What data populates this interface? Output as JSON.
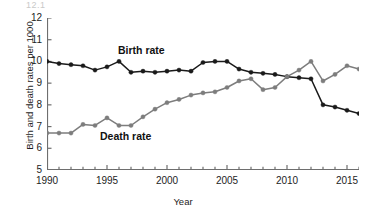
{
  "figure": {
    "crop_artifact_text": "12.1",
    "background": "#ffffff"
  },
  "chart_data": {
    "type": "line",
    "title": "",
    "xlabel": "Year",
    "ylabel": "Birth and death rates per 1000",
    "xlim": [
      1990,
      2016
    ],
    "ylim": [
      5,
      12
    ],
    "xticks": [
      1990,
      1995,
      2000,
      2005,
      2010,
      2015
    ],
    "xtick_labels": [
      "1990",
      "1995",
      "2000",
      "2005",
      "2010",
      "2015"
    ],
    "minor_xticks_interval": 1,
    "yticks": [
      5,
      6,
      7,
      8,
      9,
      10,
      11,
      12
    ],
    "ytick_labels": [
      "5",
      "6",
      "7",
      "8",
      "9",
      "10",
      "11",
      "12"
    ],
    "grid": false,
    "legend_position": "inline-annotations",
    "x": [
      1990,
      1991,
      1992,
      1993,
      1994,
      1995,
      1996,
      1997,
      1998,
      1999,
      2000,
      2001,
      2002,
      2003,
      2004,
      2005,
      2006,
      2007,
      2008,
      2009,
      2010,
      2011,
      2012,
      2013,
      2014,
      2015,
      2016
    ],
    "series": [
      {
        "name": "Birth rate",
        "color": "#1a1a1a",
        "marker": "circle",
        "label_text": "Birth rate",
        "values": [
          10.0,
          9.9,
          9.85,
          9.8,
          9.6,
          9.75,
          10.0,
          9.5,
          9.55,
          9.5,
          9.55,
          9.6,
          9.55,
          9.95,
          10.0,
          10.0,
          9.65,
          9.5,
          9.45,
          9.4,
          9.3,
          9.25,
          9.2,
          8.0,
          7.9,
          7.75,
          7.6
        ]
      },
      {
        "name": "Death rate",
        "color": "#7d7d7d",
        "marker": "circle",
        "label_text": "Death rate",
        "values": [
          6.7,
          6.7,
          6.7,
          7.1,
          7.05,
          7.4,
          7.05,
          7.05,
          7.45,
          7.8,
          8.1,
          8.25,
          8.45,
          8.55,
          8.6,
          8.8,
          9.1,
          9.2,
          8.7,
          8.8,
          9.3,
          9.6,
          10.0,
          9.1,
          9.4,
          9.8,
          9.65
        ]
      }
    ],
    "notes": {
      "crossover_year": 2006,
      "crossover_value": 9.2
    }
  }
}
